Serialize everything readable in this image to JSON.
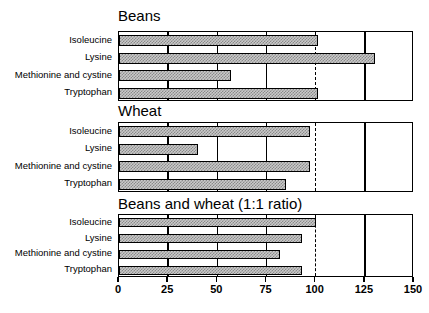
{
  "chart_data": {
    "type": "bar",
    "orientation": "horizontal",
    "title": "",
    "xlabel": "",
    "ylabel": "",
    "xlim": [
      0,
      150
    ],
    "xticks": [
      0,
      25,
      50,
      75,
      100,
      125,
      150
    ],
    "xtick_labels": [
      "0",
      "25",
      "50",
      "75",
      "100",
      "125",
      "150"
    ],
    "grid": true,
    "gridlines_at": [
      25,
      50,
      75,
      125
    ],
    "reference_line": {
      "value": 100,
      "style": "dashed"
    },
    "categories": [
      "Isoleucine",
      "Lysine",
      "Methionine and cystine",
      "Tryptophan"
    ],
    "panels": [
      {
        "title": "Beans",
        "values": [
          101,
          130,
          57,
          101
        ]
      },
      {
        "title": "Wheat",
        "values": [
          97,
          40,
          97,
          85
        ]
      },
      {
        "title": "Beans and wheat (1:1 ratio)",
        "values": [
          100,
          93,
          82,
          93
        ]
      }
    ],
    "series": [
      {
        "name": "Beans",
        "values": [
          101,
          130,
          57,
          101
        ]
      },
      {
        "name": "Wheat",
        "values": [
          97,
          40,
          97,
          85
        ]
      },
      {
        "name": "Beans and wheat (1:1 ratio)",
        "values": [
          100,
          93,
          82,
          93
        ]
      }
    ],
    "bar_fill_color": "#c9c9c9",
    "bar_edge_color": "#000000"
  }
}
